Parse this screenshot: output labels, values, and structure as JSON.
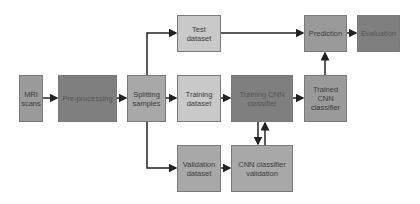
{
  "nodes": {
    "mri": {
      "label": "MRI\nscans"
    },
    "preprocessing": {
      "label": "Pre-processing"
    },
    "splitting": {
      "label": "Splitting\nsamples"
    },
    "test": {
      "label": "Test\ndataset"
    },
    "training": {
      "label": "Training\ndataset"
    },
    "training_cnn": {
      "label": "Training CNN\nclassifier"
    },
    "trained_cnn": {
      "label": "Trained\nCNN\nclassifier"
    },
    "prediction": {
      "label": "Prediction"
    },
    "evaluation": {
      "label": "Evaluation"
    },
    "validation": {
      "label": "Validation\ndataset"
    },
    "cnn_validation": {
      "label": "CNN classifier\nvalidation"
    }
  },
  "colors": {
    "arrow": "#222222",
    "border": "#7a7a7a"
  }
}
